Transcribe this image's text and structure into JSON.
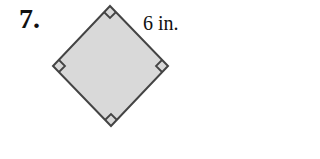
{
  "problem": {
    "number": "7.",
    "side_label": "6 in."
  },
  "figure": {
    "shape": "square (rotated 45°)",
    "fill_color": "#d9d9d9",
    "stroke_color": "#444444",
    "vertices": {
      "top": [
        110,
        6
      ],
      "right": [
        168,
        66
      ],
      "bottom": [
        111,
        126
      ],
      "left": [
        53,
        66
      ]
    },
    "right_angle_marks": 4
  }
}
